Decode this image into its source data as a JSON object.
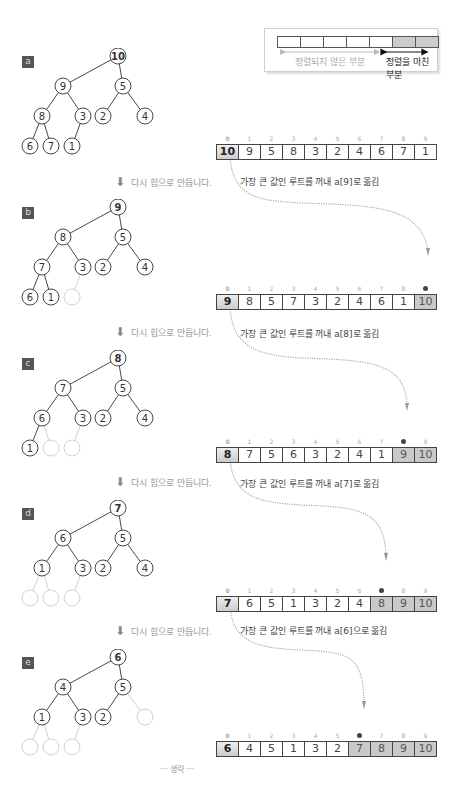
{
  "legend": {
    "unsorted_label": "정렬되지 않은 부분",
    "sorted_label": "정렬을 마친 부분",
    "cells": [
      false,
      false,
      false,
      false,
      false,
      true,
      true
    ]
  },
  "rebuild_label": "다시 힙으로 만듭니다.",
  "omit_label": "··· 생략 ···",
  "indices": [
    "0",
    "1",
    "2",
    "3",
    "4",
    "5",
    "6",
    "7",
    "8",
    "9"
  ],
  "steps": [
    {
      "label": "a",
      "tree": [
        "10",
        "9",
        "5",
        "8",
        "3",
        "2",
        "4",
        "6",
        "7",
        "1"
      ],
      "removed": [],
      "array": [
        "10",
        "9",
        "5",
        "8",
        "3",
        "2",
        "4",
        "6",
        "7",
        "1"
      ],
      "sorted_from": 10,
      "note": "가장 큰 값인 루트를 꺼내 a[9]로 옮김"
    },
    {
      "label": "b",
      "tree": [
        "9",
        "8",
        "5",
        "7",
        "3",
        "2",
        "4",
        "6",
        "1",
        ""
      ],
      "removed": [
        9
      ],
      "array": [
        "9",
        "8",
        "5",
        "7",
        "3",
        "2",
        "4",
        "6",
        "1",
        "10"
      ],
      "sorted_from": 9,
      "note": "가장 큰 값인 루트를 꺼내 a[8]로 옮김"
    },
    {
      "label": "c",
      "tree": [
        "8",
        "7",
        "5",
        "6",
        "3",
        "2",
        "4",
        "1",
        "",
        ""
      ],
      "removed": [
        8,
        9
      ],
      "array": [
        "8",
        "7",
        "5",
        "6",
        "3",
        "2",
        "4",
        "1",
        "9",
        "10"
      ],
      "sorted_from": 8,
      "note": "가장 큰 값인 루트를 꺼내 a[7]로 옮김"
    },
    {
      "label": "d",
      "tree": [
        "7",
        "6",
        "5",
        "1",
        "3",
        "2",
        "4",
        "",
        "",
        ""
      ],
      "removed": [
        7,
        8,
        9
      ],
      "array": [
        "7",
        "6",
        "5",
        "1",
        "3",
        "2",
        "4",
        "8",
        "9",
        "10"
      ],
      "sorted_from": 7,
      "note": "가장 큰 값인 루트를 꺼내 a[6]으로 옮김"
    },
    {
      "label": "e",
      "tree": [
        "6",
        "4",
        "5",
        "1",
        "3",
        "2",
        "",
        "",
        "",
        ""
      ],
      "removed": [
        6,
        7,
        8,
        9
      ],
      "array": [
        "6",
        "4",
        "5",
        "1",
        "3",
        "2",
        "7",
        "8",
        "9",
        "10"
      ],
      "sorted_from": 6,
      "note": ""
    }
  ],
  "colors": {
    "node_stroke": "#333333",
    "removed_stroke": "#cccccc",
    "sorted_fill": "#c9c9c9",
    "arrow": "#999999",
    "label_bg": "#555555"
  }
}
